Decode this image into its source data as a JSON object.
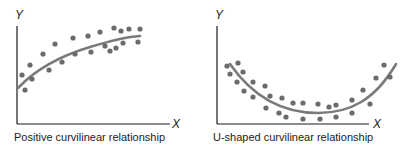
{
  "colors": {
    "axis": "#1a1a1a",
    "dot": "#6b6b6b",
    "curve": "#7a7a7a",
    "text": "#222222"
  },
  "chart_data": [
    {
      "type": "scatter",
      "title": "Positive curvilinear relationship",
      "xlabel": "X",
      "ylabel": "Y",
      "grid": false,
      "legend": null,
      "ticks": "none",
      "points_px": [
        [
          22,
          75
        ],
        [
          25,
          90
        ],
        [
          30,
          65
        ],
        [
          32,
          79
        ],
        [
          43,
          54
        ],
        [
          49,
          70
        ],
        [
          55,
          44
        ],
        [
          62,
          62
        ],
        [
          73,
          38
        ],
        [
          75,
          54
        ],
        [
          88,
          36
        ],
        [
          91,
          52
        ],
        [
          100,
          32
        ],
        [
          105,
          46
        ],
        [
          110,
          51
        ],
        [
          114,
          28
        ],
        [
          116,
          48
        ],
        [
          121,
          31
        ],
        [
          123,
          43
        ],
        [
          129,
          29
        ],
        [
          138,
          42
        ],
        [
          140,
          29
        ]
      ],
      "trend_curve": "concave increasing (logarithmic-like) fit line",
      "curve_path": "M18,88 C35,70 60,56 90,47 C110,41 125,37 140,36"
    },
    {
      "type": "scatter",
      "title": "U-shaped curvilinear relationship",
      "xlabel": "X",
      "ylabel": "Y",
      "grid": false,
      "legend": null,
      "ticks": "none",
      "points_px": [
        [
          227,
          66
        ],
        [
          230,
          74
        ],
        [
          238,
          63
        ],
        [
          243,
          72
        ],
        [
          237,
          82
        ],
        [
          244,
          91
        ],
        [
          253,
          82
        ],
        [
          253,
          97
        ],
        [
          265,
          86
        ],
        [
          266,
          108
        ],
        [
          270,
          96
        ],
        [
          279,
          113
        ],
        [
          282,
          98
        ],
        [
          286,
          117
        ],
        [
          293,
          103
        ],
        [
          303,
          103
        ],
        [
          303,
          119
        ],
        [
          318,
          104
        ],
        [
          320,
          119
        ],
        [
          329,
          107
        ],
        [
          336,
          105
        ],
        [
          336,
          117
        ],
        [
          352,
          100
        ],
        [
          352,
          113
        ],
        [
          363,
          90
        ],
        [
          370,
          104
        ],
        [
          376,
          78
        ],
        [
          384,
          65
        ],
        [
          390,
          77
        ]
      ],
      "trend_curve": "U-shaped (quadratic) fit line",
      "curve_path": "M230,64 C255,100 285,113 318,113 C350,113 375,100 396,64"
    }
  ],
  "panels": [
    {
      "y_label": "Y",
      "x_label": "X",
      "caption": "Positive curvilinear relationship"
    },
    {
      "y_label": "Y",
      "x_label": "X",
      "caption": "U-shaped curvilinear relationship"
    }
  ]
}
